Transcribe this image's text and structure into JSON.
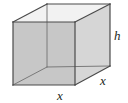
{
  "figure": {
    "name": "rectangular-box-diagram",
    "background_color": "#ffffff",
    "geometry": {
      "type": "rectangular-prism",
      "front_face": {
        "fill": "#c9c9c9",
        "points": "13,22 75,22 75,85 13,85"
      },
      "top_face": {
        "fill": "#f2f2f2",
        "points": "13,22 47,4 110,4 75,22"
      },
      "right_face": {
        "fill": "#d8d8d8",
        "points": "75,22 110,4 110,66 75,85"
      },
      "edge_color": "#4d4d4d",
      "hidden_edge_color": "#6e6e6e",
      "edge_width": 1.1,
      "vertices": {
        "front_top_left": [
          13,
          22
        ],
        "front_top_right": [
          75,
          22
        ],
        "front_bottom_left": [
          13,
          85
        ],
        "front_bottom_right": [
          75,
          85
        ],
        "back_top_left": [
          47,
          4
        ],
        "back_top_right": [
          110,
          4
        ],
        "back_bottom_left": [
          47,
          67
        ],
        "back_bottom_right": [
          110,
          66
        ]
      }
    },
    "labels": {
      "height": "h",
      "width_front": "x",
      "depth_right": "x"
    }
  }
}
